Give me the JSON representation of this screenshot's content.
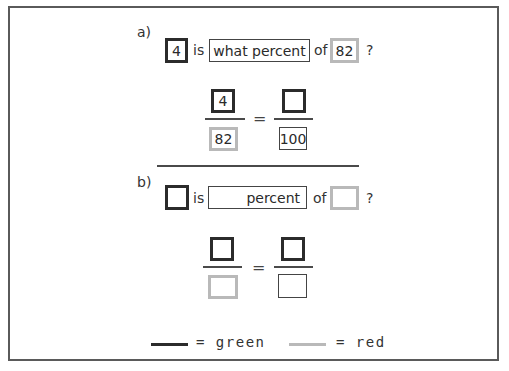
{
  "part_a": {
    "label": "a)",
    "sentence": {
      "box1_value": "4",
      "word_is": "is",
      "middle_box_text": "what percent",
      "word_of": "of",
      "box2_value": "82",
      "question_mark": "?"
    },
    "proportion": {
      "left_numerator": "4",
      "left_denominator": "82",
      "equals": "=",
      "right_numerator": "",
      "right_denominator": "100"
    }
  },
  "part_b": {
    "label": "b)",
    "sentence": {
      "box1_value": "",
      "word_is": "is",
      "middle_box_text": "percent",
      "word_of": "of",
      "box2_value": "",
      "question_mark": "?"
    },
    "proportion": {
      "left_numerator": "",
      "left_denominator": "",
      "equals": "=",
      "right_numerator": "",
      "right_denominator": ""
    }
  },
  "legend": {
    "items": [
      {
        "label": "= green",
        "color": "#2b2b2b"
      },
      {
        "label": "= red",
        "color": "#b9b9b9"
      }
    ]
  }
}
